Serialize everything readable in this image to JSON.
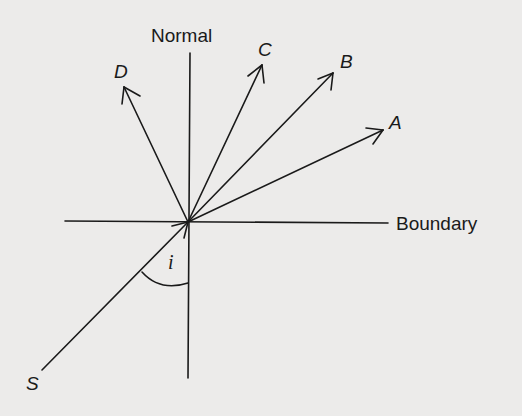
{
  "diagram": {
    "type": "ray-refraction-reflection",
    "labels": {
      "normal": "Normal",
      "boundary": "Boundary",
      "ray_a": "A",
      "ray_b": "B",
      "ray_c": "C",
      "ray_d": "D",
      "source": "S",
      "angle": "i"
    },
    "colors": {
      "background": "#ecebea",
      "ink": "#1a1a1a"
    },
    "geometry": {
      "origin": [
        188,
        222
      ],
      "normal_line": [
        [
          190,
          53
        ],
        [
          188,
          378
        ]
      ],
      "boundary_line": [
        [
          65,
          221
        ],
        [
          388,
          223
        ]
      ],
      "incident_ray": [
        [
          42,
          370
        ],
        [
          188,
          222
        ]
      ],
      "rays": [
        {
          "name": "A",
          "tip": [
            383,
            130
          ]
        },
        {
          "name": "B",
          "tip": [
            333,
            73
          ]
        },
        {
          "name": "C",
          "tip": [
            262,
            65
          ]
        },
        {
          "name": "D",
          "tip": [
            124,
            87
          ]
        }
      ]
    }
  }
}
